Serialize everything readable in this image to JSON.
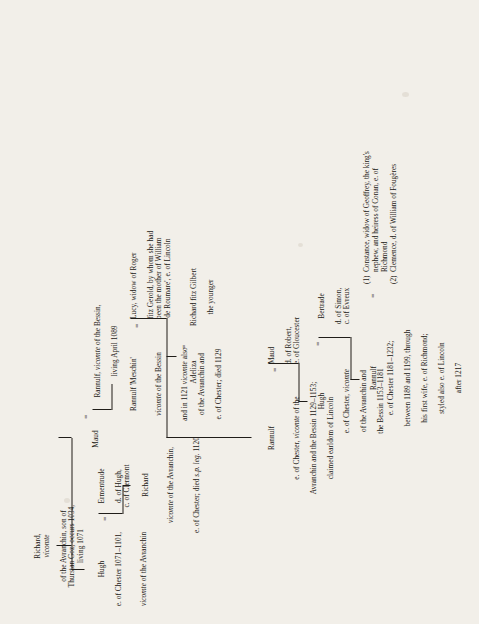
{
  "document": {
    "type": "genealogical-pedigree-chart",
    "title": "Pedigree of the earls of Chester",
    "orientation": "rotated-90-counterclockwise",
    "background_color": "#f2efe9",
    "ink_color": "#1a1713"
  },
  "people": {
    "richard_avranchin": {
      "name": "Richard, vicomte",
      "name_plain": "Richard,",
      "name_italic": "vicomte",
      "detail": "of the Avranchin, son of\nThurstan Goz; occurs 1034,\nliving 1071"
    },
    "hugh_chester": {
      "name": "Hugh",
      "detail_l1": "e. of Chester 1071–1101,",
      "detail_l2_italic": "vicomte",
      "detail_l2_rest": " of the Avranchin"
    },
    "ermentrude": {
      "name": "Ermentrude",
      "detail": "d. of Hugh,\nc.  of  Clermont"
    },
    "richard_chester": {
      "name": "Richard",
      "detail_l1_italic": "vicomte",
      "detail_l1_rest": " of the Avranchin,",
      "detail_l2_pre": "e. of Chester; died ",
      "detail_l2_italic": "s.p. leg.",
      "detail_l2_post": " 1120"
    },
    "maud": {
      "name": "Maud"
    },
    "rannulf_bessin": {
      "name_pre": "Rannulf, ",
      "name_italic": "vicomte",
      "name_post": " of the Bessin,",
      "detail": "living April 1089"
    },
    "rannulf_meschin": {
      "name": "Rannulf 'Meschin'",
      "detail_l1_italic": "vicomte",
      "detail_l1_rest": " of the Bessin",
      "detail_l2_pre": "and in 1121 ",
      "detail_l2_italic": "vicomte",
      "detail_l2_post": " also",
      "detail_l3": "of the Avranchin and",
      "detail_l4": "e. of Chester; died 1129"
    },
    "lucy": {
      "name": "Lucy, widow of Roger",
      "detail": "fitz Gerold, by whom she had\nbeen the mother of William\n'de Roumare', e. of Lincoln"
    },
    "adeliza": {
      "name": "Adeliza"
    },
    "richard_fitz_gilbert": {
      "name": "Richard fitz Gilbert",
      "detail": "the younger"
    },
    "rannulf_chester_1129": {
      "name": "Rannulf",
      "detail_l1_pre": "e. of Chester, ",
      "detail_l1_italic": "vicomte",
      "detail_l1_post": " of the",
      "detail_l2": "Avranchin and the Bessin 1129–1153;",
      "detail_l3": "claimed earldom of Lincoln"
    },
    "maud_gloucester": {
      "name": "Maud",
      "detail": "d. of Robert,\ne. of Gloucester"
    },
    "hugh_chester_1153": {
      "name": "Hugh",
      "detail_l1_pre": "e. of Chester, ",
      "detail_l1_italic": "vicomte",
      "detail_l2": "of the Avranchin and",
      "detail_l3": "the Bessin 1153–1181"
    },
    "bertrade": {
      "name": "Bertrade",
      "detail": "d.  of  Simon,\nc.  of  Evreux"
    },
    "rannulf_chester_1181": {
      "name": "Rannulf",
      "detail_l1": "e. of Chester 1181–1232;",
      "detail_l2": "between 1189 and 1199, through",
      "detail_l3": "his first wife, e. of Richmond;",
      "detail_l4": "styled also e. of Lincoln",
      "detail_l5": "after 1217"
    },
    "constance": {
      "number": "(1)",
      "text": "Constance, widow of Geoffrey, the king's\nnephew,  and  heiress  of  Conan,  e.   of\nRichmond"
    },
    "clemence": {
      "number": "(2)",
      "text": "Clemence, d. of William of Fougères"
    }
  },
  "symbols": {
    "marriage": "=",
    "marriage_richard_fitz_gilbert": "=",
    "marriage_constance_clemence": "="
  }
}
